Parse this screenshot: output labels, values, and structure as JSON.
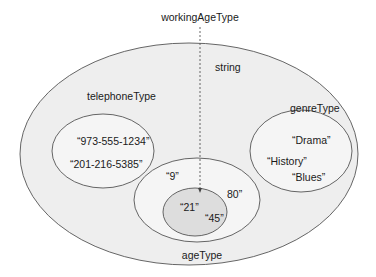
{
  "diagram": {
    "type": "nested-set-venn",
    "colors": {
      "outer_fill": "#eeeeee",
      "inner_fill": "#f5f5f5",
      "highlight_fill": "#dddddd",
      "stroke": "#555555",
      "arrow": "#555555"
    },
    "labels": {
      "working_age_type": "workingAgeType",
      "string": "string",
      "telephone_type": "telephoneType",
      "genre_type": "genreType",
      "age_type": "ageType"
    },
    "sets": {
      "string": {
        "label": "string"
      },
      "telephone_type": {
        "label": "telephoneType",
        "values": [
          "“973-555-1234”",
          "“201-216-5385”"
        ]
      },
      "genre_type": {
        "label": "genreType",
        "values": [
          "“Drama”",
          "“History”",
          "“Blues”"
        ]
      },
      "age_type": {
        "label": "ageType",
        "values": [
          "“9”",
          "80”"
        ]
      },
      "working_age_type": {
        "label": "workingAgeType",
        "values": [
          "“21”",
          "“45”"
        ]
      }
    }
  }
}
